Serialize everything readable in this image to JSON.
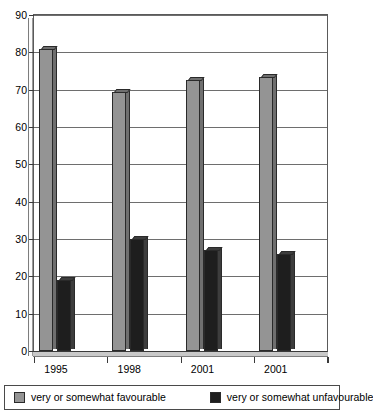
{
  "chart_data": {
    "type": "bar",
    "title": "",
    "xlabel": "",
    "ylabel": "",
    "categories": [
      "1995",
      "1998",
      "2001",
      "2001"
    ],
    "series": [
      {
        "name": "very or somewhat favourable",
        "color": "#949494",
        "values": [
          81,
          69.5,
          72.5,
          73.5
        ]
      },
      {
        "name": "very or somewhat unfavourable",
        "color": "#1e1e1e",
        "values": [
          19,
          30,
          27,
          26
        ]
      }
    ],
    "ylim": [
      0,
      90
    ],
    "ytick_step": 10,
    "yticks": [
      "0",
      "10",
      "20",
      "30",
      "40",
      "50",
      "60",
      "70",
      "80",
      "90"
    ],
    "grid": true,
    "legend_position": "bottom",
    "style": "3d-grouped-bar-grayscale"
  },
  "legend": {
    "items": [
      {
        "label": "very or somewhat favourable",
        "swatch": "fav"
      },
      {
        "label": "very or somewhat unfavourable",
        "swatch": "unfav"
      }
    ]
  }
}
